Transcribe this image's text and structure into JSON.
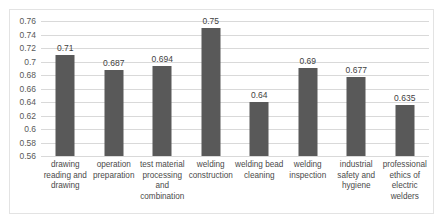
{
  "chart_data": {
    "type": "bar",
    "title": "",
    "subtitle": "",
    "xlabel": "",
    "ylabel": "",
    "ylim": [
      0.56,
      0.76
    ],
    "ytick_labels": [
      "0.76",
      "0.74",
      "0.72",
      "0.7",
      "0.68",
      "0.66",
      "0.64",
      "0.62",
      "0.6",
      "0.58",
      "0.56"
    ],
    "ytick_values": [
      0.76,
      0.74,
      0.72,
      0.7,
      0.68,
      0.66,
      0.64,
      0.62,
      0.6,
      0.58,
      0.56
    ],
    "grid": true,
    "legend": "none",
    "bar_color": "#595959",
    "gridline_color": "#d9d9d9",
    "categories": [
      "drawing reading and drawing",
      "operation preparation",
      "test material processing and combination",
      "welding construction",
      "welding bead cleaning",
      "welding inspection",
      "industrial safety and hygiene",
      "professional ethics of electric welders"
    ],
    "values": [
      0.71,
      0.687,
      0.694,
      0.75,
      0.64,
      0.69,
      0.677,
      0.635
    ],
    "value_labels": [
      "0.71",
      "0.687",
      "0.694",
      "0.75",
      "0.64",
      "0.69",
      "0.677",
      "0.635"
    ]
  }
}
